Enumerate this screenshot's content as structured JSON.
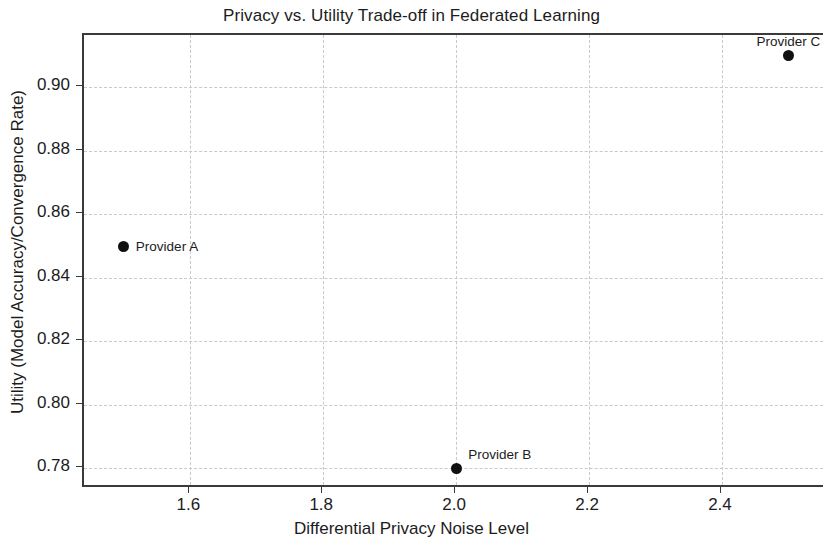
{
  "chart_data": {
    "type": "scatter",
    "title": "Privacy vs. Utility Trade-off in Federated Learning",
    "xlabel": "Differential Privacy Noise Level",
    "ylabel": "Utility (Model Accuracy/Convergence Rate)",
    "xlim": [
      1.44,
      2.555
    ],
    "ylim": [
      0.7735,
      0.9165
    ],
    "xticks": [
      "1.6",
      "1.8",
      "2.0",
      "2.2",
      "2.4"
    ],
    "xtick_values": [
      1.6,
      1.8,
      2.0,
      2.2,
      2.4
    ],
    "yticks": [
      "0.78",
      "0.80",
      "0.82",
      "0.84",
      "0.86",
      "0.88",
      "0.90"
    ],
    "ytick_values": [
      0.78,
      0.8,
      0.82,
      0.84,
      0.86,
      0.88,
      0.9
    ],
    "grid": true,
    "legend": "none",
    "marker_color": "#111111",
    "grid_color": "#c9c9c9",
    "axis_color": "#3a3a3a",
    "points": [
      {
        "label": "Provider A",
        "x": 1.5,
        "y": 0.85,
        "label_position": "right"
      },
      {
        "label": "Provider B",
        "x": 2.0,
        "y": 0.78,
        "label_position": "above"
      },
      {
        "label": "Provider C",
        "x": 2.5,
        "y": 0.91,
        "label_position": "above-center"
      }
    ]
  }
}
